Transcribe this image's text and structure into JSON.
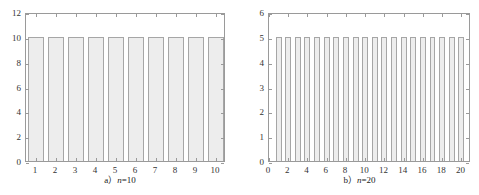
{
  "figure": {
    "background": "#ffffff",
    "bar_fill": "#ededed",
    "bar_edge": "#a6a6a6",
    "axis_color": "#9a9a9a",
    "text_color": "#333333"
  },
  "panels": [
    {
      "id": "panel-a",
      "caption_prefix": "a",
      "caption_paren": "）",
      "caption_var": "n",
      "caption_eq": "=10",
      "caption_full": "a）n=10"
    },
    {
      "id": "panel-b",
      "caption_prefix": "b",
      "caption_paren": "）",
      "caption_var": "n",
      "caption_eq": "=20",
      "caption_full": "b）n=20"
    }
  ],
  "chart_data": [
    {
      "type": "bar",
      "title": "a）n=10",
      "xlabel": "",
      "ylabel": "",
      "categories": [
        "1",
        "2",
        "3",
        "4",
        "5",
        "6",
        "7",
        "8",
        "9",
        "10"
      ],
      "x": [
        1,
        2,
        3,
        4,
        5,
        6,
        7,
        8,
        9,
        10
      ],
      "values": [
        10,
        10,
        10,
        10,
        10,
        10,
        10,
        10,
        10,
        10
      ],
      "xlim": [
        0.5,
        10.5
      ],
      "ylim": [
        0,
        12
      ],
      "xticks": [
        1,
        2,
        3,
        4,
        5,
        6,
        7,
        8,
        9,
        10
      ],
      "xticklabels": [
        "1",
        "2",
        "3",
        "4",
        "5",
        "6",
        "7",
        "8",
        "9",
        "10"
      ],
      "yticks": [
        0,
        2,
        4,
        6,
        8,
        10,
        12
      ],
      "yticklabels": [
        "0",
        "2",
        "4",
        "6",
        "8",
        "10",
        "12"
      ],
      "grid": false,
      "legend": null,
      "bar_width": 0.82
    },
    {
      "type": "bar",
      "title": "b）n=20",
      "xlabel": "",
      "ylabel": "",
      "categories": [
        "1",
        "2",
        "3",
        "4",
        "5",
        "6",
        "7",
        "8",
        "9",
        "10",
        "11",
        "12",
        "13",
        "14",
        "15",
        "16",
        "17",
        "18",
        "19",
        "20"
      ],
      "x": [
        1,
        2,
        3,
        4,
        5,
        6,
        7,
        8,
        9,
        10,
        11,
        12,
        13,
        14,
        15,
        16,
        17,
        18,
        19,
        20
      ],
      "values": [
        5,
        5,
        5,
        5,
        5,
        5,
        5,
        5,
        5,
        5,
        5,
        5,
        5,
        5,
        5,
        5,
        5,
        5,
        5,
        5
      ],
      "xlim": [
        0,
        21
      ],
      "ylim": [
        0,
        6
      ],
      "xticks": [
        0,
        2,
        4,
        6,
        8,
        10,
        12,
        14,
        16,
        18,
        20
      ],
      "xticklabels": [
        "0",
        "2",
        "4",
        "6",
        "8",
        "10",
        "12",
        "14",
        "16",
        "18",
        "20"
      ],
      "yticks": [
        0,
        1,
        2,
        3,
        4,
        5,
        6
      ],
      "yticklabels": [
        "0",
        "1",
        "2",
        "3",
        "4",
        "5",
        "6"
      ],
      "grid": false,
      "legend": null,
      "bar_width": 0.62
    }
  ]
}
